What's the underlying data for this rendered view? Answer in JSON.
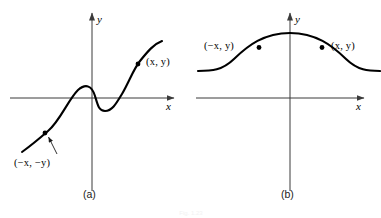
{
  "figure": {
    "caption": "Fig. 1.23",
    "background_color": "#ffffff",
    "curve_color": "#000000",
    "axis_color": "#3b3b3b"
  },
  "panels": [
    {
      "id": "a",
      "caption": "(a)",
      "axes": {
        "x_label": "x",
        "y_label": "y",
        "x_axis": {
          "x1": 10,
          "x2": 174,
          "y": 98
        },
        "y_axis": {
          "x": 92,
          "y1": 13,
          "y2": 191
        }
      },
      "curve": {
        "description": "odd-symmetric cubic-like wave",
        "path": "M 22,152 C 33,144 40,138 48,131 C 60,121 68,100 78,90 C 86,83 92,86 95,96 C 98,106 99,111 105,111 C 112,111 116,104 122,94 C 130,80 133,70 140,61 C 148,51 154,44 162,41"
      },
      "points": [
        {
          "name": "upper-right-point",
          "label": "(x, y)",
          "dot": {
            "cx": 138,
            "cy": 64,
            "r": 2.3
          },
          "label_pos": {
            "left": 146,
            "top": 57
          }
        },
        {
          "name": "lower-left-point",
          "label": "(−x, −y)",
          "dot": {
            "cx": 45,
            "cy": 133,
            "r": 2.3
          },
          "label_pos": {
            "left": 14,
            "top": 158
          },
          "leader": {
            "x1": 57,
            "y1": 154,
            "x2": 48,
            "y2": 137
          }
        }
      ]
    },
    {
      "id": "b",
      "caption": "(b)",
      "axes": {
        "x_label": "x",
        "y_label": "y",
        "x_axis": {
          "x1": 196,
          "x2": 364,
          "y": 98
        },
        "y_axis": {
          "x": 290,
          "y1": 13,
          "y2": 191
        }
      },
      "curve": {
        "description": "even-symmetric bell curve peaking on the y-axis",
        "path": "M 198,71 C 212,71 222,70 234,59 C 248,46 264,33 290,33 C 316,33 332,46 346,59 C 358,70 368,71 380,71"
      },
      "points": [
        {
          "name": "left-point",
          "label": "(−x, y)",
          "dot": {
            "cx": 259,
            "cy": 47,
            "r": 2.3
          },
          "label_pos": {
            "left": 204,
            "top": 41
          }
        },
        {
          "name": "right-point",
          "label": "(x, y)",
          "dot": {
            "cx": 322,
            "cy": 47,
            "r": 2.3
          },
          "label_pos": {
            "left": 331,
            "top": 41
          }
        }
      ]
    }
  ]
}
